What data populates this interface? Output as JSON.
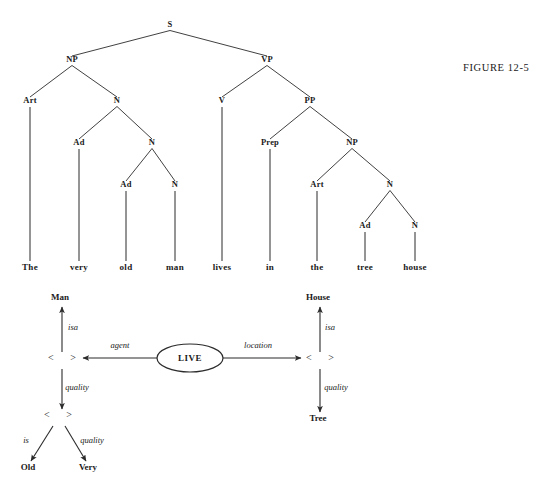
{
  "figure": {
    "caption": "FIGURE  12-5",
    "caption_x": 463,
    "caption_y": 62
  },
  "parse_tree": {
    "sentence": "The very old man lives in the tree house",
    "nodes": [
      {
        "id": "S",
        "label": "S",
        "x": 170,
        "y": 27
      },
      {
        "id": "NP1",
        "label": "NP",
        "x": 72,
        "y": 62
      },
      {
        "id": "VP",
        "label": "VP",
        "x": 267,
        "y": 62
      },
      {
        "id": "Art1",
        "label": "Art",
        "x": 30,
        "y": 103
      },
      {
        "id": "N1",
        "label": "N",
        "x": 117,
        "y": 103
      },
      {
        "id": "V",
        "label": "V",
        "x": 222,
        "y": 103
      },
      {
        "id": "PP",
        "label": "PP",
        "x": 310,
        "y": 103
      },
      {
        "id": "Ad1",
        "label": "Ad",
        "x": 79,
        "y": 145
      },
      {
        "id": "N2",
        "label": "N",
        "x": 152,
        "y": 145
      },
      {
        "id": "Prep",
        "label": "Prep",
        "x": 270,
        "y": 145
      },
      {
        "id": "NP2",
        "label": "NP",
        "x": 352,
        "y": 145
      },
      {
        "id": "Ad2",
        "label": "Ad",
        "x": 126,
        "y": 187
      },
      {
        "id": "N3",
        "label": "N",
        "x": 175,
        "y": 187
      },
      {
        "id": "Art2",
        "label": "Art",
        "x": 317,
        "y": 187
      },
      {
        "id": "N4",
        "label": "N",
        "x": 390,
        "y": 187
      },
      {
        "id": "Ad3",
        "label": "Ad",
        "x": 365,
        "y": 228
      },
      {
        "id": "N5",
        "label": "N",
        "x": 415,
        "y": 228
      }
    ],
    "edges": [
      {
        "from": "S",
        "to": "NP1"
      },
      {
        "from": "S",
        "to": "VP"
      },
      {
        "from": "NP1",
        "to": "Art1"
      },
      {
        "from": "NP1",
        "to": "N1"
      },
      {
        "from": "VP",
        "to": "V"
      },
      {
        "from": "VP",
        "to": "PP"
      },
      {
        "from": "N1",
        "to": "Ad1"
      },
      {
        "from": "N1",
        "to": "N2"
      },
      {
        "from": "PP",
        "to": "Prep"
      },
      {
        "from": "PP",
        "to": "NP2"
      },
      {
        "from": "N2",
        "to": "Ad2"
      },
      {
        "from": "N2",
        "to": "N3"
      },
      {
        "from": "NP2",
        "to": "Art2"
      },
      {
        "from": "NP2",
        "to": "N4"
      },
      {
        "from": "N4",
        "to": "Ad3"
      },
      {
        "from": "N4",
        "to": "N5"
      }
    ],
    "word_row_y": 270,
    "words": [
      {
        "text": "The",
        "x": 30,
        "from": "Art1"
      },
      {
        "text": "very",
        "x": 79,
        "from": "Ad1"
      },
      {
        "text": "old",
        "x": 126,
        "from": "Ad2"
      },
      {
        "text": "man",
        "x": 175,
        "from": "N3"
      },
      {
        "text": "lives",
        "x": 222,
        "from": "V"
      },
      {
        "text": "in",
        "x": 270,
        "from": "Prep"
      },
      {
        "text": "the",
        "x": 317,
        "from": "Art2"
      },
      {
        "text": "tree",
        "x": 365,
        "from": "Ad3"
      },
      {
        "text": "house",
        "x": 415,
        "from": "N5"
      }
    ]
  },
  "semantic_network": {
    "concepts": [
      {
        "id": "man",
        "label": "Man",
        "x": 60,
        "y": 300
      },
      {
        "id": "house",
        "label": "House",
        "x": 318,
        "y": 300
      },
      {
        "id": "tree",
        "label": "Tree",
        "x": 318,
        "y": 421
      },
      {
        "id": "old",
        "label": "Old",
        "x": 28,
        "y": 470
      },
      {
        "id": "very",
        "label": "Very",
        "x": 88,
        "y": 470
      }
    ],
    "case_frames": [
      {
        "id": "cf-man",
        "label": "<    >",
        "x": 62,
        "y": 361
      },
      {
        "id": "cf-place",
        "label": "<    >",
        "x": 320,
        "y": 361
      },
      {
        "id": "cf-adj",
        "label": "<    >",
        "x": 58,
        "y": 418
      }
    ],
    "predicate": {
      "id": "live",
      "label": "LIVE",
      "cx": 190,
      "cy": 358,
      "rx": 33,
      "ry": 14
    },
    "arcs": [
      {
        "id": "arc-isa-man",
        "label": "isa",
        "label_x": 73,
        "label_y": 330
      },
      {
        "id": "arc-agent",
        "label": "agent",
        "label_x": 120,
        "label_y": 348
      },
      {
        "id": "arc-location",
        "label": "location",
        "label_x": 258,
        "label_y": 348
      },
      {
        "id": "arc-isa-house",
        "label": "isa",
        "label_x": 330,
        "label_y": 330
      },
      {
        "id": "arc-quality-man",
        "label": "quality",
        "label_x": 77,
        "label_y": 390
      },
      {
        "id": "arc-quality-place",
        "label": "quality",
        "label_x": 336,
        "label_y": 390
      },
      {
        "id": "arc-is-old",
        "label": "is",
        "label_x": 26,
        "label_y": 443
      },
      {
        "id": "arc-quality-very",
        "label": "quality",
        "label_x": 92,
        "label_y": 443
      }
    ]
  },
  "colors": {
    "ink": "#1a1a1a",
    "line": "#2b2b2b",
    "paper": "#ffffff"
  }
}
